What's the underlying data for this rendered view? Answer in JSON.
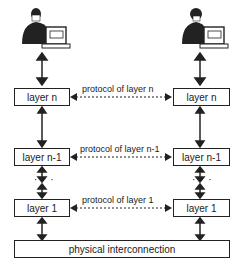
{
  "diagram": {
    "left_stack": {
      "user": "man-at-computer",
      "layers": [
        "layer n",
        "layer n-1",
        "layer 1"
      ]
    },
    "right_stack": {
      "user": "woman-at-computer",
      "layers": [
        "layer n",
        "layer n-1",
        "layer 1"
      ]
    },
    "protocols": [
      "protocol of layer n",
      "protocol of layer n-1",
      "protocol of layer 1"
    ],
    "ellipsis": "· · ·",
    "bottom": "physical interconnection"
  }
}
